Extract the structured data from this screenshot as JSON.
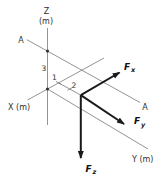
{
  "figure": {
    "type": "3d-axes-force-diagram",
    "colors": {
      "background": "#ffffff",
      "thin_line": "#787878",
      "arrow": "#1a1a1a",
      "text": "#2f2f2f"
    },
    "axes": {
      "z_label": "Z",
      "z_unit": "(m)",
      "x_label": "X (m)",
      "y_label": "Y (m)"
    },
    "section_line": {
      "label_start": "A",
      "label_end": "A"
    },
    "dimensions": {
      "along_z": "3",
      "along_x": "1",
      "along_y": "2"
    },
    "forces": [
      {
        "symbol": "F",
        "subscript": "x"
      },
      {
        "symbol": "F",
        "subscript": "y"
      },
      {
        "symbol": "F",
        "subscript": "z"
      }
    ]
  }
}
